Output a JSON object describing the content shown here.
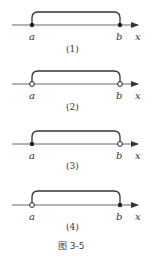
{
  "figure": {
    "caption": "图 3-5",
    "panels": [
      {
        "caption": "(1)",
        "left_label": "a",
        "right_label": "b",
        "axis_label": "x",
        "left_endpoint": "closed",
        "right_endpoint": "closed"
      },
      {
        "caption": "(2)",
        "left_label": "a",
        "right_label": "b",
        "axis_label": "x",
        "left_endpoint": "open",
        "right_endpoint": "open"
      },
      {
        "caption": "(3)",
        "left_label": "a",
        "right_label": "b",
        "axis_label": "x",
        "left_endpoint": "closed",
        "right_endpoint": "open"
      },
      {
        "caption": "(4)",
        "left_label": "a",
        "right_label": "b",
        "axis_label": "x",
        "left_endpoint": "open",
        "right_endpoint": "closed"
      }
    ]
  },
  "colors": {
    "line": "#333333",
    "axis": "#666666"
  }
}
